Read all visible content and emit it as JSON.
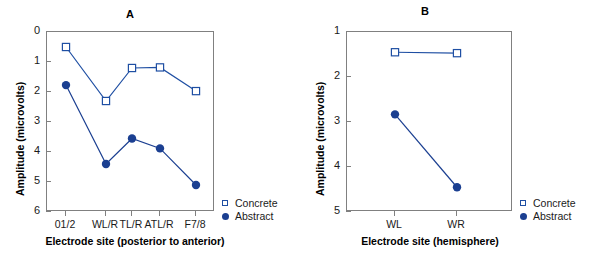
{
  "figure": {
    "background": "#ffffff",
    "series_colors": {
      "concrete": "#1f4fa3",
      "abstract": "#1b3f91",
      "axis": "#808080"
    }
  },
  "legend": {
    "concrete_label": "Concrete",
    "abstract_label": "Abstract",
    "concrete_marker": "open-square-marker",
    "abstract_marker": "filled-circle-marker"
  },
  "chart_data": [
    {
      "type": "line",
      "panel": "A",
      "title": "A",
      "xlabel": "Electrode site (posterior to anterior)",
      "ylabel": "Amplitude (microvolts)",
      "categories": [
        "01/2",
        "WL/R",
        "TL/R",
        "ATL/R",
        "F7/8"
      ],
      "yticks": [
        0,
        1,
        2,
        3,
        4,
        5,
        6
      ],
      "ylim": [
        0,
        6
      ],
      "y_inverted": true,
      "grid": false,
      "legend_position": "bottom-right-outside",
      "series": [
        {
          "name": "Concrete",
          "marker": "open-square",
          "values": [
            0.5,
            2.3,
            1.2,
            1.18,
            1.97
          ]
        },
        {
          "name": "Abstract",
          "marker": "filled-circle",
          "values": [
            1.77,
            4.4,
            3.55,
            3.88,
            5.1
          ]
        }
      ]
    },
    {
      "type": "line",
      "panel": "B",
      "title": "B",
      "xlabel": "Electrode site (hemisphere)",
      "ylabel": "Amplitude (microvolts)",
      "categories": [
        "WL",
        "WR"
      ],
      "yticks": [
        1,
        2,
        3,
        4,
        5
      ],
      "ylim": [
        1,
        5
      ],
      "y_inverted": true,
      "grid": false,
      "legend_position": "bottom-right-outside",
      "series": [
        {
          "name": "Concrete",
          "marker": "open-square",
          "values": [
            1.45,
            1.47
          ]
        },
        {
          "name": "Abstract",
          "marker": "filled-circle",
          "values": [
            2.83,
            4.45
          ]
        }
      ]
    }
  ]
}
